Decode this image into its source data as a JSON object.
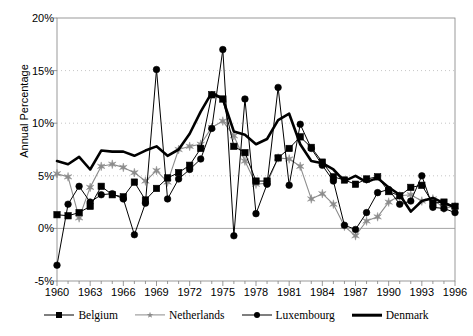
{
  "chart_data": {
    "type": "line",
    "title": "",
    "xlabel": "",
    "ylabel": "Annual Percentage",
    "ylim": [
      -5,
      20
    ],
    "xlim": [
      1960,
      1996
    ],
    "ytick_labels": [
      "20%",
      "15%",
      "10%",
      "5%",
      "0%",
      "-5%"
    ],
    "ytick_values": [
      20,
      15,
      10,
      5,
      0,
      -5
    ],
    "xtick_labels": [
      "1960",
      "1963",
      "1966",
      "1969",
      "1972",
      "1975",
      "1978",
      "1981",
      "1984",
      "1987",
      "1990",
      "1993",
      "1996"
    ],
    "xtick_values": [
      1960,
      1963,
      1966,
      1969,
      1972,
      1975,
      1978,
      1981,
      1984,
      1987,
      1990,
      1993,
      1996
    ],
    "minor_xticks_every": 1,
    "grid": "horizontal-dashed",
    "legend_position": "bottom",
    "x": [
      1960,
      1961,
      1962,
      1963,
      1964,
      1965,
      1966,
      1967,
      1968,
      1969,
      1970,
      1971,
      1972,
      1973,
      1974,
      1975,
      1976,
      1977,
      1978,
      1979,
      1980,
      1981,
      1982,
      1983,
      1984,
      1985,
      1986,
      1987,
      1988,
      1989,
      1990,
      1991,
      1992,
      1993,
      1994,
      1995,
      1996
    ],
    "series": [
      {
        "name": "Belgium",
        "color": "#000000",
        "marker": "square",
        "values": [
          1.3,
          1.2,
          1.5,
          2.1,
          4.0,
          3.2,
          3.0,
          4.4,
          2.7,
          3.8,
          4.8,
          5.3,
          6.0,
          7.6,
          12.7,
          12.3,
          7.8,
          7.2,
          4.5,
          4.5,
          6.7,
          7.6,
          8.7,
          7.7,
          6.3,
          4.9,
          4.6,
          4.2,
          4.7,
          4.9,
          3.5,
          3.1,
          3.9,
          4.1,
          2.4,
          2.5,
          2.1
        ]
      },
      {
        "name": "Netherlands",
        "color": "#8c8c8c",
        "marker": "star",
        "values": [
          5.2,
          4.9,
          1.0,
          3.9,
          5.9,
          6.1,
          5.8,
          5.3,
          4.5,
          5.5,
          4.4,
          7.5,
          7.8,
          8.0,
          9.6,
          10.2,
          8.8,
          6.4,
          4.2,
          4.3,
          6.7,
          6.6,
          5.9,
          2.8,
          3.3,
          2.3,
          0.2,
          -0.7,
          0.7,
          1.1,
          2.5,
          3.1,
          3.2,
          2.6,
          2.8,
          1.9,
          2.1
        ]
      },
      {
        "name": "Luxembourg",
        "color": "#000000",
        "marker": "circle",
        "values": [
          -3.5,
          2.3,
          4.0,
          2.5,
          3.2,
          3.3,
          2.8,
          -0.6,
          2.4,
          15.1,
          2.8,
          4.7,
          5.6,
          6.6,
          9.5,
          17.0,
          -0.7,
          12.3,
          1.4,
          4.2,
          13.4,
          4.1,
          9.9,
          7.6,
          6.0,
          4.5,
          0.3,
          -0.1,
          1.5,
          3.4,
          3.7,
          2.3,
          2.6,
          5.0,
          2.0,
          1.9,
          1.5
        ]
      },
      {
        "name": "Denmark",
        "color": "#000000",
        "marker": "none",
        "values": [
          6.4,
          6.1,
          6.8,
          5.6,
          7.4,
          7.3,
          7.3,
          6.9,
          7.4,
          7.8,
          6.9,
          7.5,
          9.0,
          11.1,
          12.9,
          12.3,
          9.2,
          8.9,
          8.0,
          8.5,
          10.3,
          10.9,
          8.0,
          6.4,
          6.2,
          5.6,
          4.5,
          5.0,
          4.4,
          4.8,
          3.9,
          3.2,
          1.6,
          2.6,
          2.9,
          2.4,
          2.0
        ]
      }
    ]
  },
  "legend": {
    "items": [
      {
        "label": "Belgium",
        "marker": "square",
        "style": "thin-black"
      },
      {
        "label": "Netherlands",
        "marker": "star",
        "style": "thin-gray"
      },
      {
        "label": "Luxembourg",
        "marker": "circle",
        "style": "thin-black"
      },
      {
        "label": "Denmark",
        "marker": "none",
        "style": "thick-black"
      }
    ]
  },
  "colors": {
    "axis": "#808080",
    "grid": "#b8b8b8",
    "belgium": "#000000",
    "netherlands": "#8c8c8c",
    "luxembourg": "#000000",
    "denmark": "#000000"
  }
}
